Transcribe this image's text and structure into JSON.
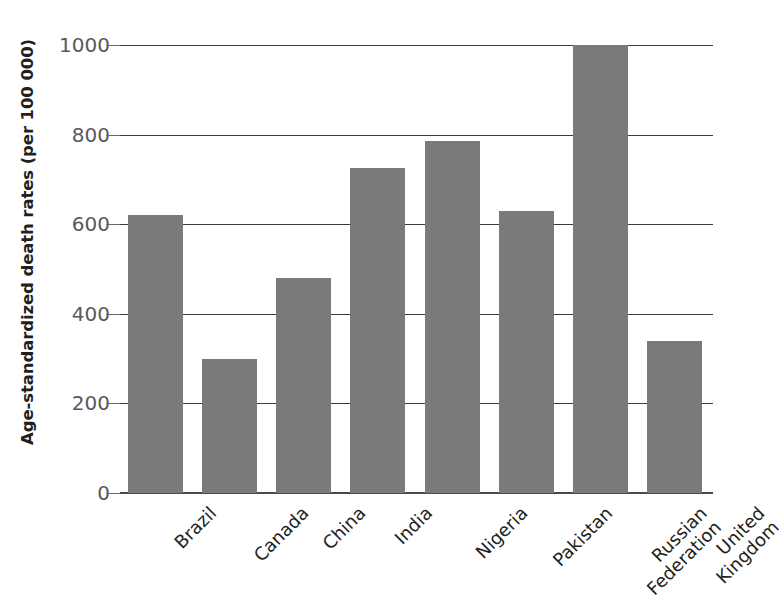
{
  "chart_data": {
    "type": "bar",
    "title": "",
    "xlabel": "",
    "ylabel": "Age-standardized death rates (per 100 000)",
    "categories": [
      "Brazil",
      "Canada",
      "China",
      "India",
      "Nigeria",
      "Pakistan",
      "Russian Federation",
      "United Kingdom"
    ],
    "category_lines": [
      [
        "Brazil"
      ],
      [
        "Canada"
      ],
      [
        "China"
      ],
      [
        "India"
      ],
      [
        "Nigeria"
      ],
      [
        "Pakistan"
      ],
      [
        "Russian",
        "Federation"
      ],
      [
        "United",
        "Kingdom"
      ]
    ],
    "values": [
      620,
      300,
      480,
      725,
      785,
      630,
      1000,
      340
    ],
    "ylim": [
      0,
      1000
    ],
    "ytick_values": [
      0,
      200,
      400,
      600,
      800,
      1000
    ],
    "ytick_labels": [
      "0",
      "200",
      "400",
      "600",
      "800",
      "1000"
    ],
    "grid": true,
    "grid_axis": "y",
    "legend": false,
    "bar_color": "#7a7a7a",
    "axis_color": "#3b3b3b",
    "tick_label_color": "#58595b",
    "text_color": "#231f20",
    "background_color": "#ffffff"
  }
}
